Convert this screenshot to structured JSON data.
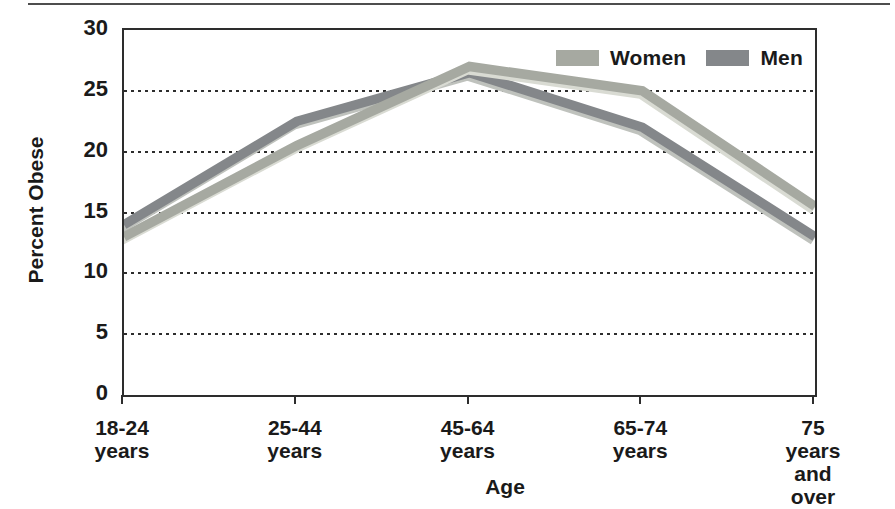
{
  "chart_data": {
    "type": "line",
    "title": "",
    "ylabel": "Percent Obese",
    "xlabel": "Age",
    "ylim": [
      0,
      30
    ],
    "yticks": [
      0,
      5,
      10,
      15,
      20,
      25,
      30
    ],
    "grid": "horizontal dotted lines at 5, 10, 15, 20, 25",
    "legend_position": "top-right inside plot",
    "categories": [
      "18-24\nyears",
      "25-44\nyears",
      "45-64\nyears",
      "65-74\nyears",
      "75 years\nand over"
    ],
    "series": [
      {
        "name": "Women",
        "values": [
          13,
          20.5,
          27,
          25,
          15.5
        ],
        "color": "#a6a9a1",
        "halo_color": "#d9dbd3"
      },
      {
        "name": "Men",
        "values": [
          14,
          22.5,
          26.5,
          22,
          13
        ],
        "color": "#84878a",
        "halo_color": "#bfc2bd"
      }
    ],
    "axis_color": "#2d2d2d",
    "text_color": "#1a1a1a"
  }
}
